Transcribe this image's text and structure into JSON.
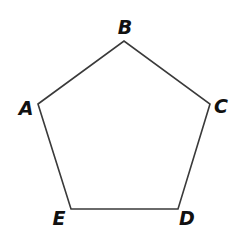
{
  "diagram": {
    "type": "regular-pentagon",
    "stroke_color": "#3a3a3a",
    "label_color": "#111111",
    "vertices": [
      {
        "name": "A",
        "x": 38,
        "y": 104,
        "label_x": 26,
        "label_y": 115
      },
      {
        "name": "B",
        "x": 124,
        "y": 41,
        "label_x": 125,
        "label_y": 34
      },
      {
        "name": "C",
        "x": 210,
        "y": 104,
        "label_x": 221,
        "label_y": 113
      },
      {
        "name": "D",
        "x": 178,
        "y": 209,
        "label_x": 187,
        "label_y": 225
      },
      {
        "name": "E",
        "x": 71,
        "y": 209,
        "label_x": 59,
        "label_y": 225
      }
    ],
    "edges": [
      [
        "A",
        "B"
      ],
      [
        "B",
        "C"
      ],
      [
        "C",
        "D"
      ],
      [
        "D",
        "E"
      ],
      [
        "E",
        "A"
      ]
    ]
  }
}
